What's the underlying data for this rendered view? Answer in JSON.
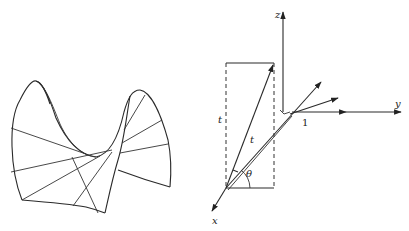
{
  "figure": {
    "left_panel": {
      "description": "Hyperbolic paraboloid (saddle surface) drawn with ruling lines"
    },
    "right_panel": {
      "axes": {
        "z_label": "z",
        "y_label": "y",
        "x_label": "x"
      },
      "labels": {
        "t_vertical": "t",
        "t_ray": "t",
        "theta": "θ",
        "unit": "1"
      }
    },
    "colors": {
      "line": "#2a2a2a",
      "background": "#ffffff"
    }
  }
}
